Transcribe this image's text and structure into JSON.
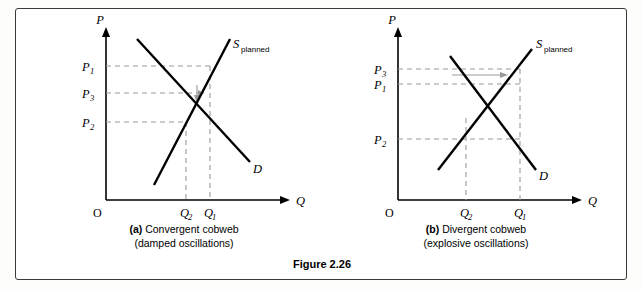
{
  "figure": {
    "number_label": "Figure 2.26"
  },
  "panels": [
    {
      "id": "a",
      "caption_line1": "(a) Convergent cobweb",
      "caption_line2": "(damped oscillations)",
      "caption_bold_prefix": "(a)",
      "axis": {
        "y_label": "P",
        "x_label": "Q",
        "origin_label": "O"
      },
      "curves": [
        {
          "name": "supply",
          "label_main": "S",
          "label_sub": "planned"
        },
        {
          "name": "demand",
          "label_main": "D",
          "label_sub": ""
        }
      ],
      "price_ticks": [
        {
          "label_main": "P",
          "label_sub": "1"
        },
        {
          "label_main": "P",
          "label_sub": "3"
        },
        {
          "label_main": "P",
          "label_sub": "2"
        }
      ],
      "quantity_ticks": [
        {
          "label_main": "Q",
          "label_sub": "2"
        },
        {
          "label_main": "Q",
          "label_sub": "1"
        }
      ]
    },
    {
      "id": "b",
      "caption_line1": "(b) Divergent cobweb",
      "caption_line2": "(explosive oscillations)",
      "caption_bold_prefix": "(b)",
      "axis": {
        "y_label": "P",
        "x_label": "Q",
        "origin_label": "O"
      },
      "curves": [
        {
          "name": "supply",
          "label_main": "S",
          "label_sub": "planned"
        },
        {
          "name": "demand",
          "label_main": "D",
          "label_sub": ""
        }
      ],
      "price_ticks": [
        {
          "label_main": "P",
          "label_sub": "3"
        },
        {
          "label_main": "P",
          "label_sub": "1"
        },
        {
          "label_main": "P",
          "label_sub": "2"
        }
      ],
      "quantity_ticks": [
        {
          "label_main": "Q",
          "label_sub": "2"
        },
        {
          "label_main": "Q",
          "label_sub": "1"
        }
      ]
    }
  ]
}
